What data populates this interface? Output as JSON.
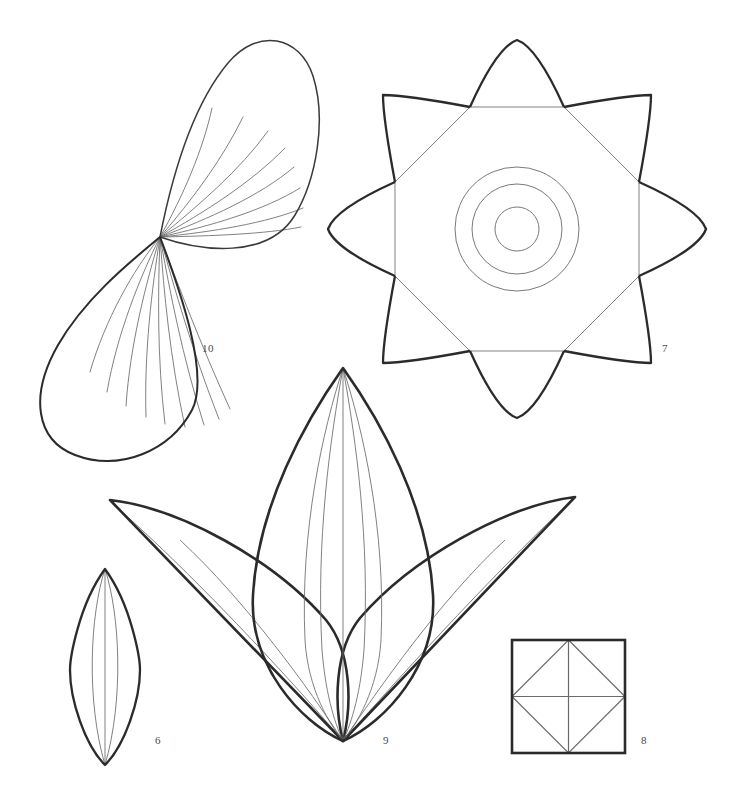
{
  "plate": {
    "title": "Botanical leaf and rosette outline plate",
    "background_color": "#ffffff",
    "width": 731,
    "height": 810,
    "outline_color": "#2b2b2b",
    "vein_color": "#6a6a6a",
    "label_color": "#4a4a4a"
  },
  "labels": [
    {
      "id": "fig-10",
      "text": "10",
      "x": 202,
      "y": 343
    },
    {
      "id": "fig-7",
      "text": "7",
      "x": 662,
      "y": 343
    },
    {
      "id": "fig-6",
      "text": "6",
      "x": 155,
      "y": 735
    },
    {
      "id": "fig-9",
      "text": "9",
      "x": 383,
      "y": 735
    },
    {
      "id": "fig-8",
      "text": "8",
      "x": 641,
      "y": 735
    }
  ],
  "figures": [
    {
      "number": "10",
      "name": "double-teardrop-leaf",
      "description": "Two opposed teardrop lobes meeting at a common apex point with radiating veins",
      "apex": [
        160,
        237
      ],
      "upper_lobe_tip": [
        228,
        42
      ],
      "lower_lobe_tip": [
        110,
        440
      ],
      "vein_count_upper": 8,
      "vein_count_lower": 9
    },
    {
      "number": "7",
      "name": "eight-point-rosette",
      "description": "Eight pointed star rosette built from alternating arcs over an octagon with three concentric circles at center",
      "center": [
        517,
        229
      ],
      "outer_radius": 189,
      "inner_radius": 122,
      "circle_radii": [
        62,
        45,
        22
      ],
      "point_count": 8
    },
    {
      "number": "9",
      "name": "three-lobe-leaf-spray",
      "description": "Central upright lance leaf flanked by two swept lateral leaves, all converging at one base point",
      "base": [
        343,
        741
      ],
      "center_apex": [
        343,
        368
      ],
      "left_tip": [
        110,
        500
      ],
      "right_tip": [
        575,
        497
      ],
      "vein_count_center": 4
    },
    {
      "number": "6",
      "name": "single-lens-leaf",
      "description": "Single pointed-oval leaf with two inner veins and a midrib",
      "top": [
        105,
        569
      ],
      "bottom": [
        105,
        765
      ],
      "half_width": 35,
      "vein_count": 3
    },
    {
      "number": "8",
      "name": "square-with-inscribed-diamond",
      "description": "Square with inscribed rotated square plus horizontal and vertical midlines",
      "x": 512,
      "y": 640,
      "size": 113
    }
  ]
}
